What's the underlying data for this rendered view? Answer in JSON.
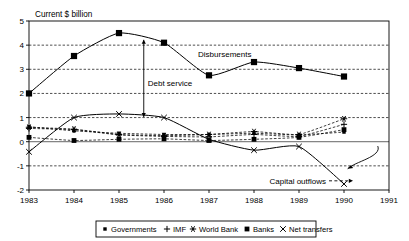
{
  "chart_data": {
    "type": "line",
    "title": "Current $ billion",
    "xlabel": "",
    "ylabel": "Current $ billion",
    "xlim": [
      1983,
      1991
    ],
    "ylim": [
      -2,
      5
    ],
    "grid": true,
    "grid_style": "dashed-horizontal",
    "legend_position": "bottom",
    "x": [
      1983,
      1984,
      1985,
      1986,
      1987,
      1988,
      1989,
      1990
    ],
    "xticklabels": [
      "1983",
      "1984",
      "1985",
      "1986",
      "1987",
      "1988",
      "1989",
      "1990",
      "1991"
    ],
    "xticks": [
      1983,
      1984,
      1985,
      1986,
      1987,
      1988,
      1989,
      1990,
      1991
    ],
    "yticklabels": [
      "5",
      "4",
      "3",
      "2",
      "1",
      "0",
      "-1",
      "-2"
    ],
    "yticks": [
      5,
      4,
      3,
      2,
      1,
      0,
      -1,
      -2
    ],
    "series": [
      {
        "name": "Disbursements",
        "marker": "filled-square-large",
        "linestyle": "solid",
        "values": [
          2.0,
          3.55,
          4.5,
          4.1,
          2.75,
          3.3,
          3.05,
          2.7
        ]
      },
      {
        "name": "Governments",
        "marker": "small-filled-square",
        "linestyle": "dashed",
        "values": [
          0.62,
          0.45,
          0.35,
          0.3,
          0.3,
          0.35,
          0.28,
          0.4
        ]
      },
      {
        "name": "IMF",
        "marker": "plus",
        "linestyle": "dashed",
        "values": [
          0.55,
          0.5,
          0.28,
          0.22,
          0.2,
          0.3,
          0.22,
          0.72
        ]
      },
      {
        "name": "World Bank",
        "marker": "asterisk",
        "linestyle": "dashed",
        "values": [
          0.6,
          0.52,
          0.3,
          0.25,
          0.3,
          0.42,
          0.3,
          0.95
        ]
      },
      {
        "name": "Banks",
        "marker": "filled-square",
        "linestyle": "dashed",
        "values": [
          0.18,
          0.05,
          0.1,
          0.12,
          0.05,
          0.1,
          0.18,
          0.5
        ]
      },
      {
        "name": "Net transfers",
        "marker": "cross",
        "linestyle": "solid",
        "values": [
          -0.42,
          1.0,
          1.15,
          1.0,
          0.1,
          -0.35,
          -0.2,
          -1.75
        ]
      }
    ],
    "annotations": [
      {
        "text": "Debt service",
        "x": 1985.55,
        "y": 2.45,
        "kind": "bracket-label"
      },
      {
        "text": "Disbursements",
        "x": 1987.35,
        "y": 3.62,
        "kind": "series-label"
      },
      {
        "text": "Capital outflows",
        "x": 1989.6,
        "y": -1.62,
        "kind": "arrow-label"
      }
    ]
  },
  "legend": {
    "items": [
      {
        "label": "Governments",
        "marker": "small-filled-square"
      },
      {
        "label": "IMF",
        "marker": "plus"
      },
      {
        "label": "World Bank",
        "marker": "asterisk"
      },
      {
        "label": "Banks",
        "marker": "filled-square"
      },
      {
        "label": "Net transfers",
        "marker": "cross"
      }
    ]
  }
}
